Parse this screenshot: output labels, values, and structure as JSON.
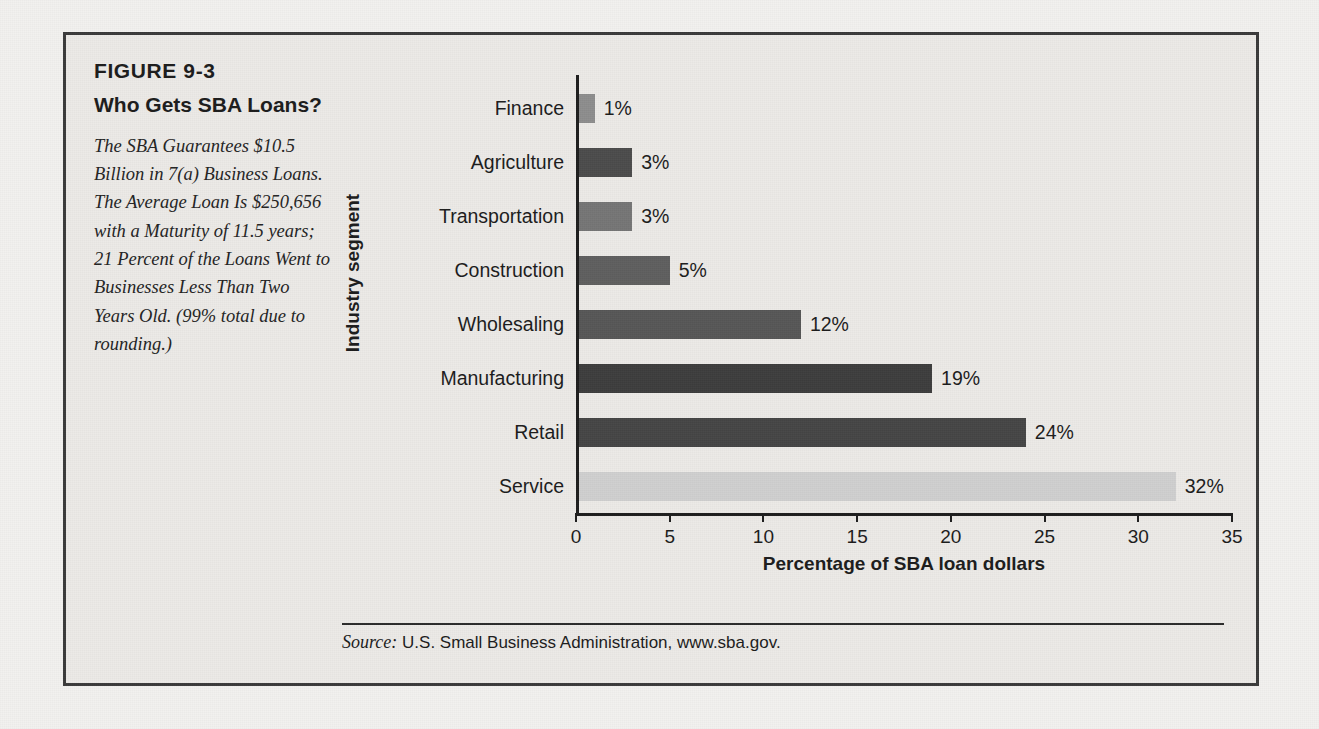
{
  "figure": {
    "number": "FIGURE 9-3",
    "title": "Who Gets SBA Loans?",
    "description": "The SBA Guarantees $10.5 Billion in 7(a) Business Loans. The Average Loan Is $250,656 with a Maturity of 11.5 years; 21 Percent of the Loans Went to Businesses Less Than Two Years Old. (99% total due to rounding.)"
  },
  "source": {
    "label": "Source:",
    "text": "U.S. Small Business Administration, www.sba.gov."
  },
  "chart_data": {
    "type": "bar",
    "orientation": "horizontal",
    "title": "Who Gets SBA Loans?",
    "xlabel": "Percentage of SBA loan dollars",
    "ylabel": "Industry segment",
    "xlim": [
      0,
      35
    ],
    "xticks": [
      0,
      5,
      10,
      15,
      20,
      25,
      30,
      35
    ],
    "xtick_labels": [
      "0",
      "5",
      "10",
      "15",
      "20",
      "25",
      "30",
      "35"
    ],
    "grid": false,
    "legend": false,
    "categories": [
      "Finance",
      "Agriculture",
      "Transportation",
      "Construction",
      "Wholesaling",
      "Manufacturing",
      "Retail",
      "Service"
    ],
    "values": [
      1,
      3,
      3,
      5,
      12,
      19,
      24,
      32
    ],
    "value_labels": [
      "1%",
      "3%",
      "3%",
      "5%",
      "12%",
      "19%",
      "24%",
      "32%"
    ],
    "bar_colors": [
      "#8d8d8d",
      "#4b4b4b",
      "#757575",
      "#5e5e5e",
      "#565656",
      "#3d3d3d",
      "#454545",
      "#cfcfcf"
    ],
    "bars": [
      {
        "category": "Finance",
        "value": 1,
        "label": "1%",
        "color": "#8d8d8d"
      },
      {
        "category": "Agriculture",
        "value": 3,
        "label": "3%",
        "color": "#4b4b4b"
      },
      {
        "category": "Transportation",
        "value": 3,
        "label": "3%",
        "color": "#757575"
      },
      {
        "category": "Construction",
        "value": 5,
        "label": "5%",
        "color": "#5e5e5e"
      },
      {
        "category": "Wholesaling",
        "value": 12,
        "label": "12%",
        "color": "#565656"
      },
      {
        "category": "Manufacturing",
        "value": 19,
        "label": "19%",
        "color": "#3d3d3d"
      },
      {
        "category": "Retail",
        "value": 24,
        "label": "24%",
        "color": "#454545"
      },
      {
        "category": "Service",
        "value": 32,
        "label": "32%",
        "color": "#cfcfcf"
      }
    ]
  }
}
